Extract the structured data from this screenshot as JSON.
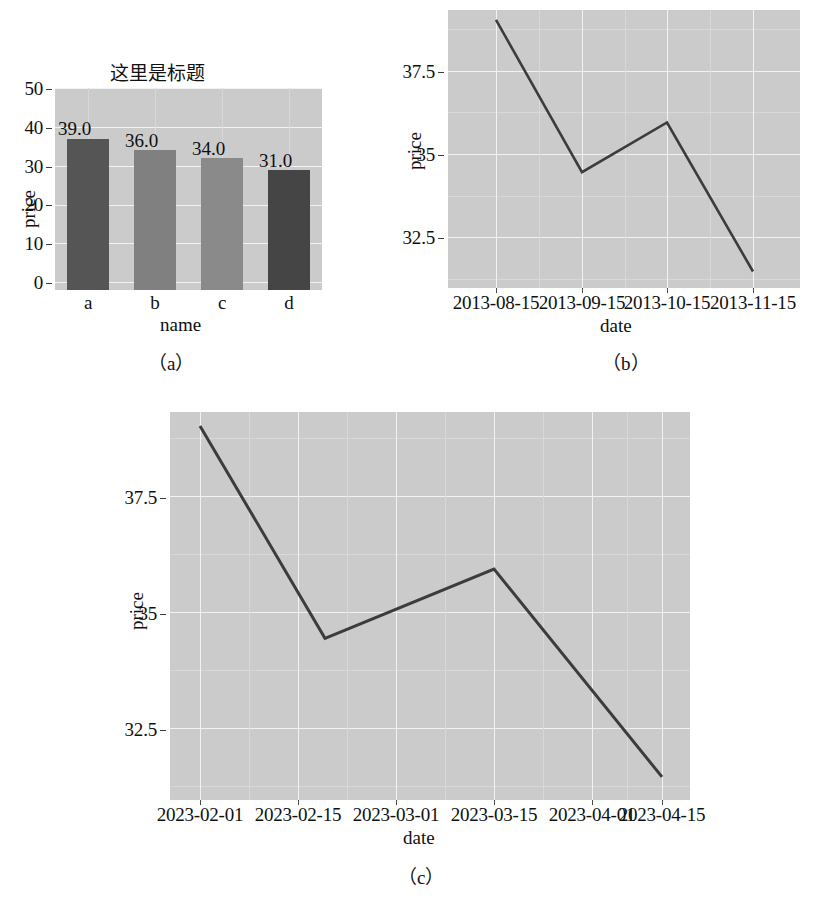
{
  "page": {
    "background": "#ffffff",
    "plot_background": "#cbcbcb",
    "grid_color": "#f2f2f2",
    "line_color": "#3c3c3c"
  },
  "figures": [
    {
      "caption": "（a）",
      "chart_data": {
        "type": "bar",
        "title": "这里是标题",
        "xlabel": "name",
        "ylabel": "price",
        "categories": [
          "a",
          "b",
          "c",
          "d"
        ],
        "values": [
          39.0,
          36.0,
          34.0,
          31.0
        ],
        "value_labels": [
          "39.0",
          "36.0",
          "34.0",
          "31.0"
        ],
        "bar_colors": [
          "#555555",
          "#808080",
          "#8a8a8a",
          "#454545"
        ],
        "ylim": [
          0,
          52
        ],
        "yticks": [
          0,
          10,
          20,
          30,
          40,
          50
        ],
        "ytick_labels": [
          "0",
          "10",
          "20",
          "30",
          "40",
          "50"
        ],
        "grid": true,
        "legend": "none"
      }
    },
    {
      "caption": "（b）",
      "chart_data": {
        "type": "line",
        "title": "",
        "xlabel": "date",
        "ylabel": "price",
        "x": [
          "2013-08-15",
          "2013-09-15",
          "2013-10-15",
          "2013-11-15"
        ],
        "values": [
          39.0,
          34.4,
          35.9,
          31.4
        ],
        "series": [
          {
            "name": "price",
            "values": [
              39.0,
              34.4,
              35.9,
              31.4
            ]
          }
        ],
        "ylim": [
          30.9,
          39.3
        ],
        "yticks": [
          32.5,
          35,
          37.5
        ],
        "ytick_labels": [
          "32.5",
          "35",
          "37.5"
        ],
        "grid": true,
        "legend": "none"
      }
    },
    {
      "caption": "（c）",
      "chart_data": {
        "type": "line",
        "title": "",
        "xlabel": "date",
        "ylabel": "price",
        "x": [
          "2023-02-01",
          "2023-02-15",
          "2023-03-01",
          "2023-03-15",
          "2023-04-01",
          "2023-04-15"
        ],
        "values": [
          39.0,
          34.4,
          35.9,
          31.4
        ],
        "series": [
          {
            "name": "price",
            "values": [
              39.0,
              34.4,
              35.9,
              31.4
            ]
          }
        ],
        "ylim": [
          30.9,
          39.3
        ],
        "yticks": [
          32.5,
          35,
          37.5
        ],
        "ytick_labels": [
          "32.5",
          "35",
          "37.5"
        ],
        "grid": true,
        "legend": "none"
      }
    }
  ]
}
